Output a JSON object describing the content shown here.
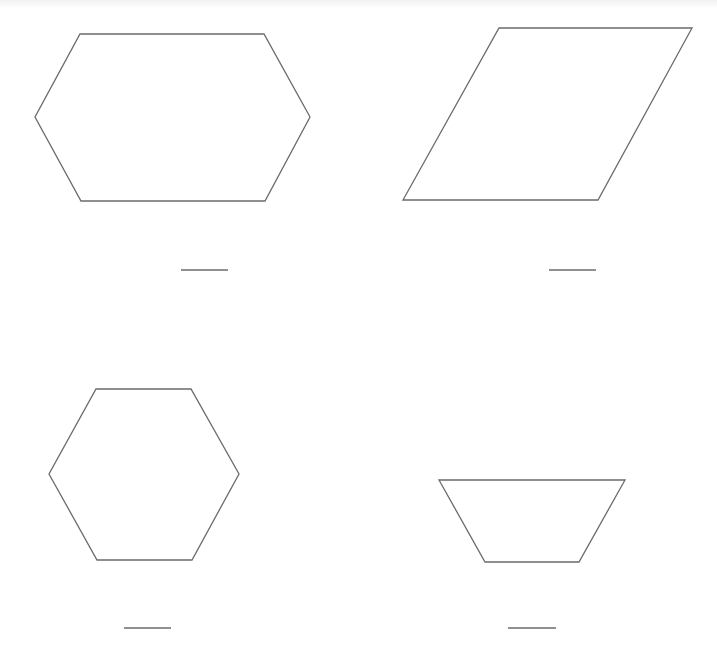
{
  "worksheet": {
    "shapes": [
      {
        "id": "shape-1",
        "kind": "elongated-hexagon",
        "points": "80,34 264,34 310,117 265,201 81,201 35,117",
        "answer_line": {
          "x1": 181,
          "y1": 270,
          "x2": 228,
          "y2": 270
        }
      },
      {
        "id": "shape-2",
        "kind": "parallelogram",
        "points": "499,28 692,28 598,200 403,200",
        "answer_line": {
          "x1": 549,
          "y1": 270,
          "x2": 596,
          "y2": 270
        }
      },
      {
        "id": "shape-3",
        "kind": "regular-hexagon",
        "points": "96,389 191,389 239,474 192,560 97,560 49,474",
        "answer_line": {
          "x1": 124,
          "y1": 628,
          "x2": 171,
          "y2": 628
        }
      },
      {
        "id": "shape-4",
        "kind": "trapezoid",
        "points": "439,480 625,480 579,562 485,562",
        "answer_line": {
          "x1": 508,
          "y1": 628,
          "x2": 556,
          "y2": 628
        }
      }
    ],
    "colors": {
      "stroke": "#6b6b6b",
      "background": "#ffffff"
    }
  }
}
